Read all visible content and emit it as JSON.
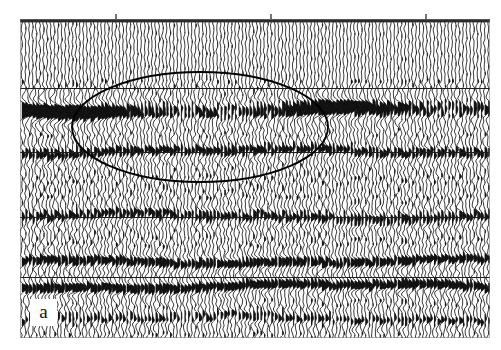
{
  "figure": {
    "kind": "seismic-section",
    "panel_letter": "a",
    "background_color": "#ffffff",
    "ink_color": "#111111",
    "annotation_color": "#000000",
    "width_px": 501,
    "height_px": 350
  },
  "panel": {
    "x": 20,
    "y": 19,
    "width": 470,
    "height": 319,
    "top_bar_color": "#2b2b2b",
    "border_color": "#8d8d8d"
  },
  "top_axis": {
    "bar_y": 0,
    "bar_thickness": 4,
    "tick_marks_x": [
      96,
      251,
      406
    ],
    "trace_ticks_count": 118
  },
  "gridlines": {
    "color": "#1d1d1d",
    "y_values": [
      69,
      133,
      198,
      258
    ]
  },
  "annotation_ellipse": {
    "shape": "ellipse",
    "center_x": 180,
    "center_y": 108,
    "radius_x": 128,
    "radius_y": 55,
    "stroke": "#000000",
    "stroke_width": 1.9,
    "fill": "none",
    "meaning": "highlighted-anomaly-zone"
  },
  "chart_data": {
    "type": "line",
    "title": "",
    "subtitle": "",
    "xlabel": "",
    "ylabel": "",
    "display_mode": "wiggle-variable-area",
    "trace_count": 130,
    "trace_spacing_px": 3.62,
    "sample_count": 319,
    "xlim": [
      0,
      470
    ],
    "ylim": [
      0,
      319
    ],
    "grid": true,
    "legend_position": "none",
    "annotations": [
      {
        "text": "a",
        "x": 30,
        "y": 299,
        "type": "panel-letter"
      },
      {
        "type": "ellipse",
        "cx": 180,
        "cy": 108,
        "rx": 128,
        "ry": 55
      }
    ],
    "reflectors": [
      {
        "name": "strong-event-1",
        "center_y": 92,
        "amplitude": 1.0,
        "fill_black": true,
        "thickness": 13,
        "freq": 0.135
      },
      {
        "name": "event-2",
        "center_y": 133,
        "amplitude": 0.34,
        "fill_black": false,
        "thickness": 10,
        "freq": 0.15
      },
      {
        "name": "event-3",
        "center_y": 198,
        "amplitude": 0.3,
        "fill_black": false,
        "thickness": 10,
        "freq": 0.15
      },
      {
        "name": "event-4",
        "center_y": 243,
        "amplitude": 0.42,
        "fill_black": true,
        "thickness": 9,
        "freq": 0.16
      },
      {
        "name": "event-5",
        "center_y": 268,
        "amplitude": 0.48,
        "fill_black": true,
        "thickness": 9,
        "freq": 0.16
      },
      {
        "name": "event-6",
        "center_y": 300,
        "amplitude": 0.22,
        "fill_black": false,
        "thickness": 9,
        "freq": 0.17
      }
    ],
    "series": [
      {
        "name": "background-noise",
        "values": [
          0.14,
          0.16,
          0.13,
          0.15,
          0.17,
          0.14,
          0.12,
          0.16
        ]
      }
    ]
  }
}
